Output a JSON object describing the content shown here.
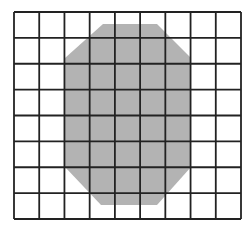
{
  "diagram": {
    "type": "grid-with-shaded-octagon",
    "grid": {
      "columns": 9,
      "rows": 8,
      "left": 14,
      "top": 12,
      "right": 241,
      "bottom": 219,
      "line_color": "#222222",
      "line_width": 1.8,
      "background": "#ffffff"
    },
    "shape": {
      "name": "octagon",
      "fill": "#b3b3b3",
      "points": [
        [
          103,
          24
        ],
        [
          157,
          24
        ],
        [
          191,
          58
        ],
        [
          191,
          167
        ],
        [
          157,
          205
        ],
        [
          101,
          205
        ],
        [
          65,
          167
        ],
        [
          65,
          58
        ]
      ]
    }
  }
}
